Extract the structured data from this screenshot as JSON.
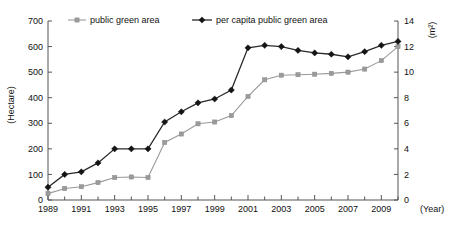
{
  "chart_data": {
    "type": "line",
    "title": "",
    "xlabel": "(Year)",
    "ylabel": "(Hectare)",
    "y2label": "(m²)",
    "grid": false,
    "legend_position": "top",
    "xlim": [
      1989,
      2010
    ],
    "ylim": [
      0,
      700
    ],
    "y2lim": [
      0,
      14
    ],
    "x": [
      1989,
      1990,
      1991,
      1992,
      1993,
      1994,
      1995,
      1996,
      1997,
      1998,
      1999,
      2000,
      2001,
      2002,
      2003,
      2004,
      2005,
      2006,
      2007,
      2008,
      2009,
      2010
    ],
    "xticklabels": [
      "1989",
      "1991",
      "1993",
      "1995",
      "1997",
      "1999",
      "2001",
      "2003",
      "2005",
      "2007",
      "2009"
    ],
    "xticks_major": [
      1989,
      1991,
      1993,
      1995,
      1997,
      1999,
      2001,
      2003,
      2005,
      2007,
      2009
    ],
    "yticklabels": [
      "0",
      "100",
      "200",
      "300",
      "400",
      "500",
      "600",
      "700"
    ],
    "yticks": [
      0,
      100,
      200,
      300,
      400,
      500,
      600,
      700
    ],
    "y2ticklabels": [
      "0",
      "2",
      "4",
      "6",
      "8",
      "10",
      "12",
      "14"
    ],
    "y2ticks": [
      0,
      2,
      4,
      6,
      8,
      10,
      12,
      14
    ],
    "series": [
      {
        "name": "public green area",
        "axis": "left",
        "color": "#9a9a9a",
        "marker": "square",
        "values": [
          25,
          45,
          52,
          68,
          88,
          90,
          88,
          225,
          258,
          298,
          305,
          330,
          405,
          470,
          488,
          490,
          492,
          495,
          500,
          512,
          545,
          600
        ]
      },
      {
        "name": "per capita public green area",
        "axis": "right",
        "color": "#141414",
        "marker": "diamond",
        "values": [
          1.0,
          2.0,
          2.2,
          2.9,
          4.0,
          4.0,
          4.0,
          6.1,
          6.9,
          7.6,
          7.9,
          8.6,
          11.9,
          12.1,
          12.0,
          11.7,
          11.5,
          11.4,
          11.2,
          11.6,
          12.1,
          12.4
        ]
      }
    ],
    "legend": [
      {
        "label": "public green area",
        "color": "#9a9a9a",
        "marker": "square"
      },
      {
        "label": "per capita public green area",
        "color": "#141414",
        "marker": "diamond"
      }
    ]
  }
}
